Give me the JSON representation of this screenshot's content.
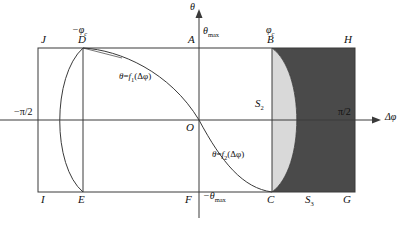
{
  "figure": {
    "type": "math-diagram",
    "axes": {
      "y_axis_label": "θ",
      "x_axis_label": "Δφ",
      "y_max_tick": "θ",
      "y_max_tick_sub": "max",
      "y_min_tick": "−θ",
      "y_min_tick_sub": "max",
      "x_left_tick": "−π/2",
      "x_right_tick": "π/2",
      "origin_label": "O"
    },
    "curves": [
      {
        "id": "f1",
        "label_theta": "θ",
        "label_eq": "=",
        "label_fn": "f",
        "label_sub": "1",
        "label_arg": "(Δφ)"
      },
      {
        "id": "f2",
        "label_theta": "θ",
        "label_eq": "=",
        "label_fn": "f",
        "label_sub": "2",
        "label_arg": "(Δφ)"
      }
    ],
    "points": [
      {
        "name": "J",
        "label": "J"
      },
      {
        "name": "D",
        "label": "D"
      },
      {
        "name": "A",
        "label": "A"
      },
      {
        "name": "B",
        "label": "B"
      },
      {
        "name": "H",
        "label": "H"
      },
      {
        "name": "I",
        "label": "I"
      },
      {
        "name": "E",
        "label": "E"
      },
      {
        "name": "F",
        "label": "F"
      },
      {
        "name": "C",
        "label": "C"
      },
      {
        "name": "G",
        "label": "G"
      },
      {
        "name": "O",
        "label": "O"
      }
    ],
    "critical_labels": [
      {
        "name": "minus-phi-c",
        "main": "−φ",
        "sub": "c"
      },
      {
        "name": "phi-c",
        "main": "φ",
        "sub": "c"
      }
    ],
    "regions": [
      {
        "name": "S2",
        "main": "S",
        "sub": "2",
        "fill": "#d9d9d9"
      },
      {
        "name": "S3",
        "main": "S",
        "sub": "3",
        "fill": "#4a4a4a"
      }
    ],
    "colors": {
      "line": "#3a3a3a",
      "light_shade": "#d9d9d9",
      "dark_shade": "#4a4a4a",
      "background": "#ffffff"
    }
  }
}
